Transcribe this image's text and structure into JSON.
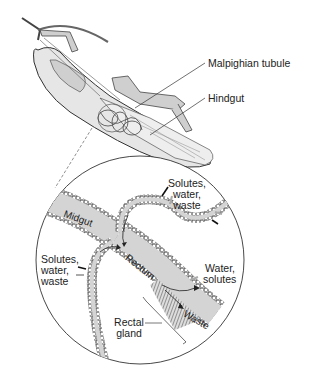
{
  "labels": {
    "malpighian_tubule": "Malpighian tubule",
    "hindgut": "Hindgut",
    "midgut": "Midgut",
    "rectum": "Rectum",
    "waste": "Waste",
    "solutes_top": [
      "Solutes,",
      "water,",
      "waste"
    ],
    "solutes_left": [
      "Solutes,",
      "water,",
      "waste"
    ],
    "water_solutes": [
      "Water,",
      "solutes"
    ],
    "rectal_gland": [
      "Rectal",
      "gland"
    ]
  },
  "colors": {
    "tissue": "#d4d4d4",
    "gland": "#9a9a9a",
    "line": "#333333",
    "background": "#ffffff"
  }
}
